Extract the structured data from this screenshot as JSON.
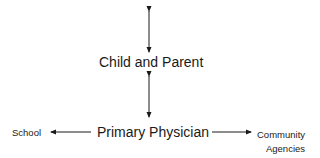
{
  "diagram": {
    "nodes": {
      "child_parent": "Child and Parent",
      "primary_physician": "Primary Physician",
      "school": "School",
      "community_line1": "Community",
      "community_line2": "Agencies"
    },
    "edges": [
      {
        "from": "(above)",
        "to": "Child and Parent",
        "direction": "bidirectional"
      },
      {
        "from": "Child and Parent",
        "to": "Primary Physician",
        "direction": "bidirectional"
      },
      {
        "from": "Primary Physician",
        "to": "School",
        "direction": "one-way"
      },
      {
        "from": "Primary Physician",
        "to": "Community Agencies",
        "direction": "one-way"
      }
    ],
    "colors": {
      "line": "#1a1a1a",
      "text": "#1a1a1a",
      "background": "#ffffff"
    }
  }
}
